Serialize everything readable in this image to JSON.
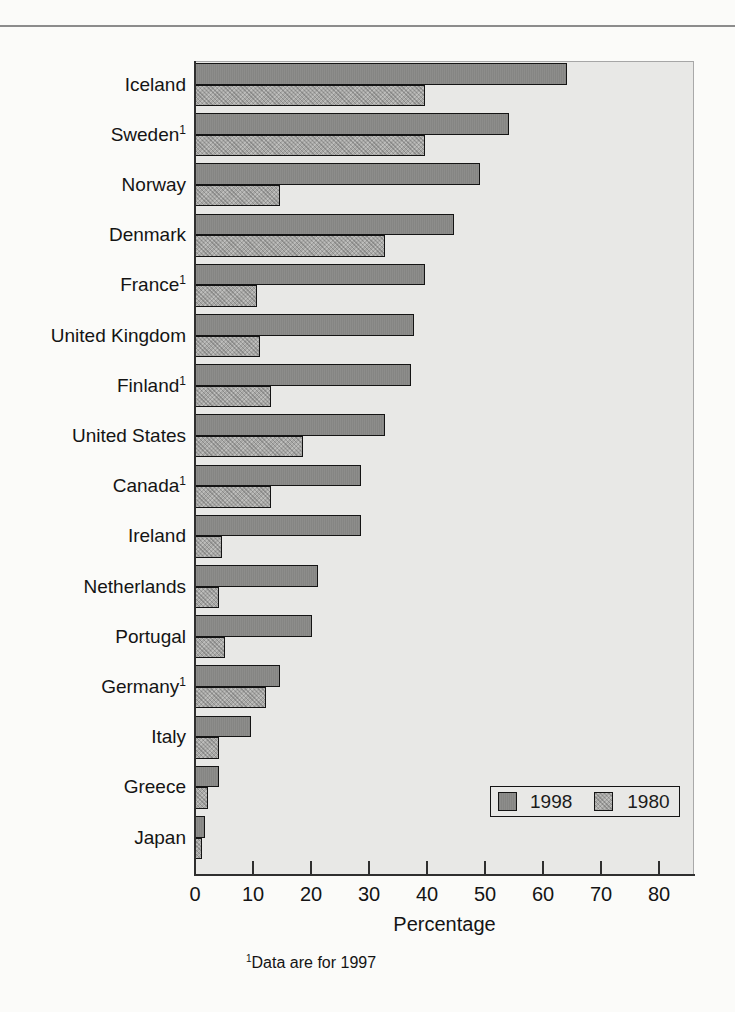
{
  "page": {
    "background": "#fbfbf9",
    "top_rule_color": "#8c8c8c"
  },
  "chart_data": {
    "type": "bar",
    "orientation": "horizontal",
    "title": "",
    "xlabel": "Percentage",
    "x_ticks": [
      0,
      10,
      20,
      30,
      40,
      50,
      60,
      70,
      80
    ],
    "xlim": [
      0,
      86
    ],
    "grid": false,
    "plot_background": "#e8e8e6",
    "bar_border_color": "#141414",
    "legend_position": "inside-bottom-right",
    "footnote_marker": "1",
    "footnote_text": "Data are for 1997",
    "categories": [
      {
        "label": "Iceland",
        "sup": ""
      },
      {
        "label": "Sweden",
        "sup": "1"
      },
      {
        "label": "Norway",
        "sup": ""
      },
      {
        "label": "Denmark",
        "sup": ""
      },
      {
        "label": "France",
        "sup": "1"
      },
      {
        "label": "United Kingdom",
        "sup": ""
      },
      {
        "label": "Finland",
        "sup": "1"
      },
      {
        "label": "United States",
        "sup": ""
      },
      {
        "label": "Canada",
        "sup": "1"
      },
      {
        "label": "Ireland",
        "sup": ""
      },
      {
        "label": "Netherlands",
        "sup": ""
      },
      {
        "label": "Portugal",
        "sup": ""
      },
      {
        "label": "Germany",
        "sup": "1"
      },
      {
        "label": "Italy",
        "sup": ""
      },
      {
        "label": "Greece",
        "sup": ""
      },
      {
        "label": "Japan",
        "sup": ""
      }
    ],
    "series": [
      {
        "name": "1998",
        "color": "#8d8d8b",
        "values": [
          64,
          54,
          49,
          44.5,
          39.5,
          37.5,
          37,
          32.5,
          28.5,
          28.5,
          21,
          20,
          14.5,
          9.5,
          4,
          1.5
        ]
      },
      {
        "name": "1980",
        "color": "#a8a8a6",
        "values": [
          39.5,
          39.5,
          14.5,
          32.5,
          10.5,
          11,
          13,
          18.5,
          13,
          4.5,
          4,
          5,
          12,
          4,
          2,
          1
        ]
      }
    ]
  }
}
